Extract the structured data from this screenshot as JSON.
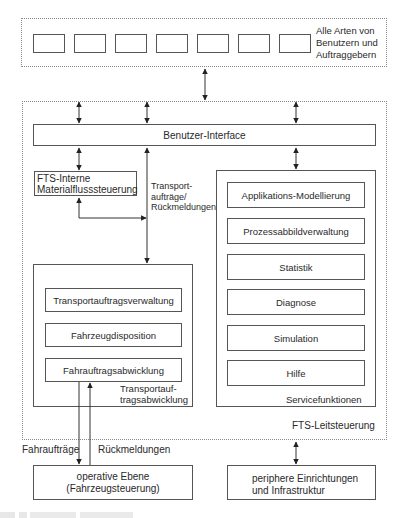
{
  "users_group": {
    "label_lines": [
      "Alle Arten von",
      "Benutzern und",
      "Auftraggebern"
    ],
    "user_box_count": 7
  },
  "fts_leitsteuerung": {
    "label": "FTS-Leitsteuerung",
    "benutzer_interface": "Benutzer-Interface",
    "materialfluss": {
      "lines": [
        "FTS-Interne",
        "Materialflusssteuerung"
      ]
    },
    "transport_link_label": [
      "Transport-",
      "aufträge/",
      "Rückmeldungen"
    ],
    "transportauftragsabwicklung": {
      "label_lines": [
        "Transportauf-",
        "tragsabwicklung"
      ],
      "items": [
        "Transportauftragsverwaltung",
        "Fahrzeugdisposition",
        "Fahrauftragsabwicklung"
      ]
    },
    "servicefunktionen": {
      "label": "Servicefunktionen",
      "items": [
        "Applikations-Modellierung",
        "Prozessabbildverwaltung",
        "Statistik",
        "Diagnose",
        "Simulation",
        "Hilfe"
      ]
    }
  },
  "bottom_links": {
    "down_label": "Fahraufträge",
    "up_label": "Rückmeldungen"
  },
  "operative_ebene": {
    "lines": [
      "operative Ebene",
      "(Fahrzeugsteuerung)"
    ]
  },
  "periphere": {
    "lines": [
      "periphere Einrichtungen",
      "und Infrastruktur"
    ]
  }
}
